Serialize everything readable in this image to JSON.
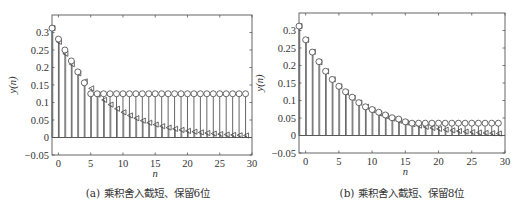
{
  "chart_data": [
    {
      "type": "stem",
      "panel": "a",
      "caption": "(a)  乘积舍入截短、保留6位",
      "xlabel": "n",
      "ylabel": "y(n)",
      "xlim": [
        -1,
        30
      ],
      "ylim": [
        -0.05,
        0.35
      ],
      "xticks": [
        0,
        5,
        10,
        15,
        20,
        25,
        30
      ],
      "xtick_labels": [
        "0",
        "5",
        "10",
        "15",
        "20",
        "25",
        "30"
      ],
      "yticks": [
        -0.05,
        0,
        0.05,
        0.1,
        0.15,
        0.2,
        0.25,
        0.3
      ],
      "ytick_labels": [
        "−0.05",
        "0",
        "0.05",
        "0.1",
        "0.15",
        "0.2",
        "0.25",
        "0.3"
      ],
      "x": [
        -1,
        0,
        1,
        2,
        3,
        4,
        5,
        6,
        7,
        8,
        9,
        10,
        11,
        12,
        13,
        14,
        15,
        16,
        17,
        18,
        19,
        20,
        21,
        22,
        23,
        24,
        25,
        26,
        27,
        28,
        29
      ],
      "series": [
        {
          "name": "quantized",
          "marker": "circle",
          "values": [
            0.3125,
            0.28125,
            0.25,
            0.21875,
            0.1875,
            0.15625,
            0.125,
            0.125,
            0.125,
            0.125,
            0.125,
            0.125,
            0.125,
            0.125,
            0.125,
            0.125,
            0.125,
            0.125,
            0.125,
            0.125,
            0.125,
            0.125,
            0.125,
            0.125,
            0.125,
            0.125,
            0.125,
            0.125,
            0.125,
            0.125,
            0.125
          ]
        },
        {
          "name": "ideal",
          "marker": "triangle-left",
          "values": [
            0.3125,
            0.2734,
            0.2393,
            0.2094,
            0.1832,
            0.1603,
            0.1403,
            0.1227,
            0.1074,
            0.094,
            0.0822,
            0.0719,
            0.0629,
            0.0551,
            0.0482,
            0.0422,
            0.0369,
            0.0323,
            0.0282,
            0.0247,
            0.0216,
            0.0189,
            0.0166,
            0.0145,
            0.0127,
            0.0111,
            0.0097,
            0.0085,
            0.0074,
            0.0065,
            0.0057
          ]
        }
      ],
      "grid": false
    },
    {
      "type": "stem",
      "panel": "b",
      "caption": "(b)  乘积舍入截短、保留8位",
      "xlabel": "n",
      "ylabel": "y(n)",
      "xlim": [
        -1,
        30
      ],
      "ylim": [
        -0.05,
        0.35
      ],
      "xticks": [
        0,
        5,
        10,
        15,
        20,
        25,
        30
      ],
      "xtick_labels": [
        "0",
        "5",
        "10",
        "15",
        "20",
        "25",
        "30"
      ],
      "yticks": [
        -0.05,
        0,
        0.05,
        0.1,
        0.15,
        0.2,
        0.25,
        0.3
      ],
      "ytick_labels": [
        "−0.05",
        "0",
        "0.05",
        "0.1",
        "0.15",
        "0.2",
        "0.25",
        "0.3"
      ],
      "x": [
        -1,
        0,
        1,
        2,
        3,
        4,
        5,
        6,
        7,
        8,
        9,
        10,
        11,
        12,
        13,
        14,
        15,
        16,
        17,
        18,
        19,
        20,
        21,
        22,
        23,
        24,
        25,
        26,
        27,
        28,
        29
      ],
      "series": [
        {
          "name": "quantized",
          "marker": "circle",
          "values": [
            0.3125,
            0.2734,
            0.2383,
            0.2109,
            0.1836,
            0.1602,
            0.1406,
            0.125,
            0.1094,
            0.0938,
            0.082,
            0.0742,
            0.0664,
            0.0586,
            0.0508,
            0.0469,
            0.0391,
            0.0352,
            0.0352,
            0.0352,
            0.0352,
            0.0352,
            0.0352,
            0.0352,
            0.0352,
            0.0352,
            0.0352,
            0.0352,
            0.0352,
            0.0352,
            0.0352
          ]
        },
        {
          "name": "ideal",
          "marker": "triangle-left",
          "values": [
            0.3125,
            0.2734,
            0.2393,
            0.2094,
            0.1832,
            0.1603,
            0.1403,
            0.1227,
            0.1074,
            0.094,
            0.0822,
            0.0719,
            0.0629,
            0.0551,
            0.0482,
            0.0422,
            0.0369,
            0.0323,
            0.0282,
            0.0247,
            0.0216,
            0.0189,
            0.0166,
            0.0145,
            0.0127,
            0.0111,
            0.0097,
            0.0085,
            0.0074,
            0.0065,
            0.0057
          ]
        }
      ],
      "grid": false
    }
  ]
}
